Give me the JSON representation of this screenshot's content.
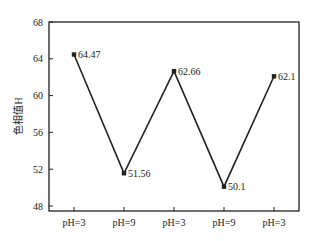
{
  "chart_data": {
    "type": "line",
    "title": "",
    "xlabel": "",
    "ylabel": "色相值H",
    "categories": [
      "pH=3",
      "pH=9",
      "pH=3",
      "pH=9",
      "pH=3"
    ],
    "series": [
      {
        "name": "色相值H",
        "values": [
          64.47,
          51.56,
          62.66,
          50.1,
          62.1
        ]
      }
    ],
    "data_labels": [
      "64.47",
      "51.56",
      "62.66",
      "50.1",
      "62.1"
    ],
    "ylim": [
      48,
      68
    ],
    "yticks": [
      48,
      52,
      56,
      60,
      64,
      68
    ],
    "grid": false,
    "legend": "none",
    "colors": {
      "line": "#222222",
      "axis": "#222222"
    }
  }
}
